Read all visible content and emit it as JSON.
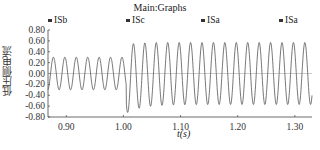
{
  "chart_data": {
    "type": "line",
    "title": "Main:Graphs",
    "xlabel": "t(s)",
    "ylabel": "低压侧电流",
    "xlim": [
      0.868,
      1.33
    ],
    "ylim": [
      -0.8,
      0.8
    ],
    "x_ticks": [
      "0.90",
      "1.00",
      "1.10",
      "1.20",
      "1.30"
    ],
    "x_tick_values": [
      0.9,
      1.0,
      1.1,
      1.2,
      1.3
    ],
    "y_ticks": [
      "0.80",
      "0.60",
      "0.40",
      "0.20",
      "0.00",
      "-0.20",
      "-0.40",
      "-0.60",
      "-0.80"
    ],
    "y_tick_values": [
      0.8,
      0.6,
      0.4,
      0.2,
      0.0,
      -0.2,
      -0.4,
      -0.6,
      -0.8
    ],
    "grid": false,
    "zero_line": true,
    "legend": [
      "ISb",
      "ISc",
      "ISa",
      "ISa"
    ],
    "series": [
      {
        "name": "low-voltage side current",
        "frequency_hz": 50,
        "segments": [
          {
            "t_start": 0.868,
            "t_end": 1.005,
            "amplitude": 0.3,
            "description": "pre-fault steady state"
          },
          {
            "t_start": 1.005,
            "t_end": 1.05,
            "peak_max": 0.62,
            "trough_min": -0.72,
            "description": "transient after disturbance"
          },
          {
            "t_start": 1.05,
            "t_end": 1.33,
            "amplitude": 0.57,
            "description": "post-disturbance steady state"
          }
        ]
      }
    ],
    "annotations": []
  },
  "colors": {
    "line": "#555555",
    "axis": "#444444",
    "zero_line": "#999999"
  }
}
